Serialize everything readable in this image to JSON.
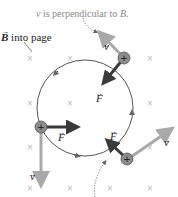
{
  "caption": {
    "perpendicular_note": "v⃗ is perpendicular to B⃗.",
    "perpendicular_note_v": "v",
    "perpendicular_note_text": " is perpendicular to ",
    "perpendicular_note_b": "B",
    "perpendicular_note_end": "."
  },
  "field_label": {
    "symbol": "B",
    "text": " into page"
  },
  "vector_labels": {
    "velocity": "v",
    "force": "F"
  },
  "charges": [
    {
      "id": "top-right",
      "sign": "+"
    },
    {
      "id": "left",
      "sign": "+"
    },
    {
      "id": "bottom-right",
      "sign": "+"
    }
  ],
  "colors": {
    "velocity_arrow": "#a9a9a9",
    "force_arrow": "#3a3a3a",
    "orbit": "#555555",
    "charge_fill": "#8c8c8c",
    "field_marks": "#bdbdbd",
    "text_gray": "#8a8a8a",
    "text_dark": "#222222"
  },
  "field_marks": {
    "symbol": "×",
    "positions": [
      [
        30,
        58
      ],
      [
        70,
        58
      ],
      [
        150,
        58
      ],
      [
        30,
        103
      ],
      [
        70,
        103
      ],
      [
        110,
        103
      ],
      [
        150,
        103
      ],
      [
        30,
        147
      ],
      [
        70,
        147
      ],
      [
        110,
        147
      ],
      [
        150,
        147
      ],
      [
        30,
        188
      ],
      [
        70,
        188
      ],
      [
        110,
        188
      ],
      [
        150,
        188
      ]
    ]
  }
}
